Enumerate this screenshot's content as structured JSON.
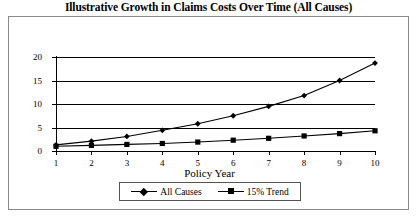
{
  "chart_data": {
    "type": "line",
    "title": "Illustrative Growth in Claims Costs Over Time (All Causes)",
    "xlabel": "Policy Year",
    "ylabel": "",
    "x": [
      1,
      2,
      3,
      4,
      5,
      6,
      7,
      8,
      9,
      10
    ],
    "xticklabels": [
      "1",
      "2",
      "3",
      "4",
      "5",
      "6",
      "7",
      "8",
      "9",
      "10"
    ],
    "yticklabels": [
      "0",
      "5",
      "10",
      "15",
      "20"
    ],
    "yticks": [
      0,
      5,
      10,
      15,
      20
    ],
    "ylim": [
      0,
      20
    ],
    "xlim": [
      1,
      10
    ],
    "grid": "horizontal",
    "legend_position": "bottom",
    "series": [
      {
        "name": "All Causes",
        "marker": "diamond",
        "color": "#000000",
        "values": [
          1.3,
          2.1,
          3.1,
          4.4,
          5.8,
          7.5,
          9.5,
          11.8,
          15.0,
          18.7
        ]
      },
      {
        "name": "15% Trend",
        "marker": "square",
        "color": "#000000",
        "values": [
          1.0,
          1.2,
          1.4,
          1.6,
          1.9,
          2.3,
          2.7,
          3.2,
          3.7,
          4.3
        ]
      }
    ]
  },
  "legend": {
    "items": [
      {
        "label": "All Causes"
      },
      {
        "label": "15% Trend"
      }
    ]
  }
}
